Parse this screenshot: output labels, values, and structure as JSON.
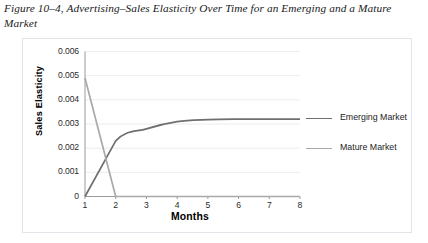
{
  "caption": "Figure 10–4, Advertising–Sales Elasticity Over Time for an Emerging and a Mature Market",
  "axis": {
    "ylabel": "Sales Elasticity",
    "xlabel": "Months"
  },
  "colors": {
    "emerging": "#6f6f6f",
    "mature": "#a9a9a9",
    "grid": "#ececf2",
    "axis": "#9a9a9a",
    "panel_border": "#e3e3ea",
    "panel_background": "#ffffff"
  },
  "legend": [
    {
      "label": "Emerging Market",
      "color": "#6f6f6f"
    },
    {
      "label": "Mature Market",
      "color": "#a9a9a9"
    }
  ],
  "chart_data": {
    "type": "line",
    "title": "Advertising–Sales Elasticity Over Time for an Emerging and a Mature Market",
    "xlabel": "Months",
    "ylabel": "Sales Elasticity",
    "x": [
      1,
      2,
      3,
      4,
      5,
      6,
      7,
      8
    ],
    "xticklabels": [
      "1",
      "2",
      "3",
      "4",
      "5",
      "6",
      "7",
      "8"
    ],
    "yticklabels": [
      "0",
      "0.001",
      "0.002",
      "0.003",
      "0.004",
      "0.005",
      "0.006"
    ],
    "xlim": [
      1,
      8
    ],
    "ylim": [
      0,
      0.006
    ],
    "ytick_step": 0.001,
    "grid": "horizontal",
    "legend_position": "right",
    "series": [
      {
        "name": "Emerging Market",
        "color": "#6f6f6f",
        "values": [
          0,
          0.0023,
          0.0028,
          0.0031,
          0.00318,
          0.0032,
          0.0032,
          0.0032
        ]
      },
      {
        "name": "Mature Market",
        "color": "#a9a9a9",
        "values": [
          0.0049,
          0,
          0,
          0,
          0,
          0,
          0,
          0
        ]
      }
    ]
  }
}
